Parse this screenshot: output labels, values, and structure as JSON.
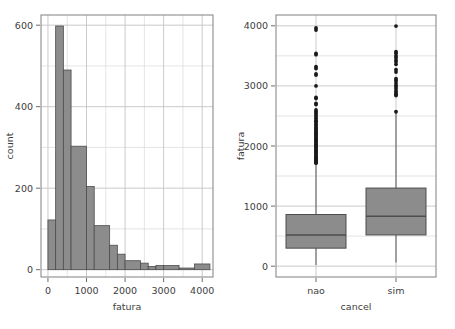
{
  "chart_data": [
    {
      "type": "bar",
      "panel": "left",
      "title": "",
      "xlabel": "fatura",
      "ylabel": "count",
      "xlim": [
        -180,
        4280
      ],
      "ylim": [
        -18,
        625
      ],
      "xticks": [
        0,
        1000,
        2000,
        3000,
        4000
      ],
      "xticklabels": [
        "0",
        "1000",
        "2000",
        "3000",
        "4000"
      ],
      "yticks": [
        0,
        200,
        400,
        600
      ],
      "yticklabels": [
        "0",
        "200",
        "400",
        "600"
      ],
      "grid": true,
      "bin_width": 200,
      "bin_edges": [
        0,
        200,
        400,
        600,
        800,
        1000,
        1200,
        1400,
        1600,
        1800,
        2000,
        2200,
        2400,
        2600,
        2800,
        3000,
        3200,
        3400,
        3600,
        3800,
        4000,
        4200
      ],
      "categories": [
        "0-200",
        "200-400",
        "400-600",
        "600-800",
        "800-1000",
        "1000-1200",
        "1200-1400",
        "1400-1600",
        "1600-1800",
        "1800-2000",
        "2000-2200",
        "2200-2400",
        "2400-2600",
        "2600-2800",
        "2800-3000",
        "3000-3200",
        "3200-3400",
        "3400-3600",
        "3600-3800",
        "3800-4000",
        "4000-4200"
      ],
      "values": [
        122,
        598,
        490,
        303,
        303,
        204,
        204,
        108,
        108,
        60,
        60,
        38,
        38,
        22,
        16,
        10,
        10,
        12,
        10,
        4,
        14
      ],
      "bars": [
        {
          "x0": 0,
          "x1": 200,
          "height": 122
        },
        {
          "x0": 200,
          "x1": 400,
          "height": 598
        },
        {
          "x0": 400,
          "x1": 600,
          "height": 490
        },
        {
          "x0": 600,
          "x1": 1000,
          "height": 303
        },
        {
          "x0": 1000,
          "x1": 1200,
          "height": 204
        },
        {
          "x0": 1200,
          "x1": 1600,
          "height": 108
        },
        {
          "x0": 1600,
          "x1": 1800,
          "height": 60
        },
        {
          "x0": 1800,
          "x1": 2000,
          "height": 38
        },
        {
          "x0": 2000,
          "x1": 2400,
          "height": 22
        },
        {
          "x0": 2400,
          "x1": 2600,
          "height": 16
        },
        {
          "x0": 2600,
          "x1": 2800,
          "height": 8
        },
        {
          "x0": 2800,
          "x1": 3000,
          "height": 10
        },
        {
          "x0": 3000,
          "x1": 3400,
          "height": 10
        },
        {
          "x0": 3400,
          "x1": 3800,
          "height": 4
        },
        {
          "x0": 3800,
          "x1": 4200,
          "height": 14
        }
      ]
    },
    {
      "type": "box",
      "panel": "right",
      "title": "",
      "xlabel": "cancel",
      "ylabel": "fatura",
      "ylim": [
        -180,
        4180
      ],
      "yticks": [
        0,
        1000,
        2000,
        3000,
        4000
      ],
      "yticklabels": [
        "0",
        "1000",
        "2000",
        "3000",
        "4000"
      ],
      "grid": true,
      "categories": [
        "nao",
        "sim"
      ],
      "boxes": [
        {
          "label": "nao",
          "whisker_low": 20,
          "q1": 300,
          "median": 520,
          "q3": 860,
          "whisker_high": 1700,
          "outliers": [
            3965,
            3930,
            3540,
            3520,
            3320,
            3290,
            3200,
            3180,
            3000,
            2810,
            2790,
            2710,
            2690,
            2600,
            2570,
            2550,
            2520,
            2490,
            2460,
            2430,
            2410,
            2390,
            2360,
            2340,
            2310,
            2290,
            2270,
            2250,
            2230,
            2210,
            2190,
            2170,
            2150,
            2130,
            2110,
            2090,
            2070,
            2050,
            2030,
            2010,
            1990,
            1970,
            1950,
            1930,
            1910,
            1890,
            1870,
            1850,
            1830,
            1810,
            1790,
            1775,
            1760,
            1745,
            1730,
            1715
          ]
        },
        {
          "label": "sim",
          "whisker_low": 60,
          "q1": 520,
          "median": 830,
          "q3": 1300,
          "whisker_high": 2560,
          "outliers": [
            3995,
            3570,
            3545,
            3500,
            3470,
            3430,
            3400,
            3360,
            3270,
            3230,
            3120,
            3090,
            3050,
            3010,
            2980,
            2950,
            2910,
            2880,
            2860,
            2840,
            2570
          ]
        }
      ]
    }
  ],
  "style": {
    "fill": "#8c8c8c",
    "stroke": "#4d4d4d",
    "grid_color": "#d9d9d9",
    "panel_border": "#808080",
    "text_color": "#3d3d3d",
    "outlier_color": "#1a1a1a",
    "background": "#ffffff"
  }
}
